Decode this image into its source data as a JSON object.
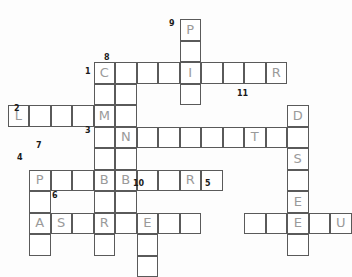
{
  "puzzle": {
    "title": "Crossword Puzzle Grid",
    "cell_size": 21.5,
    "origin_x": 29,
    "origin_y": 62,
    "colors": {
      "background": "#fdfdfd",
      "cell_fill": "#ffffff",
      "cell_border": "#5a5a5a",
      "letter": "#9a9a9a",
      "clue_number": "#1a1a1a"
    },
    "across": [
      {
        "number": "1",
        "row": 0,
        "col": 3,
        "length": 9,
        "letters": [
          "C",
          "",
          "",
          "",
          "I",
          "",
          "",
          "",
          "R"
        ]
      },
      {
        "number": "2",
        "row": 2,
        "col": -1,
        "length": 6,
        "letters": [
          "L",
          "",
          "",
          "",
          "M",
          ""
        ]
      },
      {
        "number": "3",
        "row": 3,
        "col": 3,
        "length": 9,
        "letters": [
          "",
          "N",
          "",
          "",
          "",
          "",
          "",
          "T",
          ""
        ]
      },
      {
        "number": "4",
        "row": 5,
        "col": 0,
        "length": 9,
        "letters": [
          "P",
          "",
          "",
          "",
          "B",
          "",
          "",
          "R",
          ""
        ]
      },
      {
        "number": "5",
        "row": 7,
        "col": 10,
        "length": 5,
        "letters": [
          "",
          "",
          "E",
          "",
          "U"
        ]
      },
      {
        "number": "6",
        "row": 7,
        "col": 1,
        "length": 7,
        "letters": [
          "S",
          "",
          "R",
          "",
          "E",
          "",
          ""
        ]
      }
    ],
    "down": [
      {
        "number": "7",
        "row": 5,
        "col": 0,
        "length": 4,
        "letters": [
          "P",
          "",
          "A",
          ""
        ]
      },
      {
        "number": "8",
        "row": 0,
        "col": 3,
        "length": 9,
        "letters": [
          "C",
          "",
          "M",
          "",
          "",
          "B",
          "",
          "R",
          ""
        ]
      },
      {
        "number": "9",
        "row": -2,
        "col": 7,
        "length": 4,
        "letters": [
          "P",
          "",
          "I",
          ""
        ]
      },
      {
        "number": "10",
        "row": 7,
        "col": 5,
        "length": 3,
        "letters": [
          "E",
          "",
          ""
        ]
      },
      {
        "number": "11",
        "row": 2,
        "col": 12,
        "length": 7,
        "letters": [
          "D",
          "",
          "S",
          "",
          "E",
          "",
          ""
        ]
      }
    ],
    "extra_cells": [
      {
        "row": 1,
        "col": 4,
        "letter": ""
      },
      {
        "row": 4,
        "col": 4,
        "letter": ""
      },
      {
        "row": 6,
        "col": 4,
        "letter": ""
      },
      {
        "row": 3,
        "col": 12,
        "letter": ""
      },
      {
        "row": 6,
        "col": 12,
        "letter": ""
      }
    ],
    "clue_labels": [
      {
        "number": "1",
        "x": 85,
        "y": 68,
        "align": "left"
      },
      {
        "number": "2",
        "x": 14,
        "y": 105,
        "align": "left"
      },
      {
        "number": "3",
        "x": 85,
        "y": 127,
        "align": "left"
      },
      {
        "number": "4",
        "x": 17,
        "y": 154,
        "align": "left"
      },
      {
        "number": "5",
        "x": 205,
        "y": 180,
        "align": "left"
      },
      {
        "number": "6",
        "x": 52,
        "y": 192,
        "align": "left"
      },
      {
        "number": "7",
        "x": 36,
        "y": 142,
        "align": "left"
      },
      {
        "number": "8",
        "x": 104,
        "y": 54,
        "align": "left"
      },
      {
        "number": "9",
        "x": 169,
        "y": 20,
        "align": "left"
      },
      {
        "number": "10",
        "x": 133,
        "y": 180,
        "align": "left"
      },
      {
        "number": "11",
        "x": 237,
        "y": 90,
        "align": "left"
      }
    ]
  }
}
